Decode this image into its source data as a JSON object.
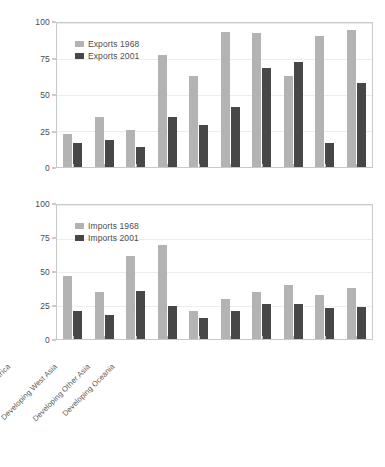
{
  "chart_data": [
    {
      "type": "bar",
      "title": "",
      "xlabel": "",
      "ylabel": "",
      "ylim": [
        0,
        100
      ],
      "yticks": [
        0,
        25,
        50,
        75,
        100
      ],
      "grid": true,
      "legend_position": "top-left",
      "categories": [
        "Western Europe",
        "USA & Canada",
        "Japan, Australia, New Zealand",
        "Central and Eastern Europe",
        "Rep. of S. Africa",
        "Latin America",
        "Developing Africa",
        "Developing West Asia",
        "Developing Other Asia",
        "Developing Oceania"
      ],
      "series": [
        {
          "name": "Exports 1968",
          "color": "#b3b3b3",
          "values": [
            23,
            35,
            26,
            78,
            63,
            94,
            93,
            63,
            91,
            95
          ]
        },
        {
          "name": "Exports 2001",
          "color": "#474747",
          "values": [
            17,
            19,
            14,
            35,
            29,
            42,
            69,
            73,
            17,
            58
          ]
        }
      ]
    },
    {
      "type": "bar",
      "title": "",
      "xlabel": "",
      "ylabel": "",
      "ylim": [
        0,
        100
      ],
      "yticks": [
        0,
        25,
        50,
        75,
        100
      ],
      "grid": true,
      "legend_position": "top-left",
      "categories": [
        "Western Europe",
        "USA & Canada",
        "Japan, Australia, New Zealand",
        "Central and Eastern Europe",
        "Rep. of S. Africa",
        "Latin America",
        "Developing Africa",
        "Developing West Asia",
        "Developing Other Asia",
        "Developing Oceania"
      ],
      "series": [
        {
          "name": "Imports 1968",
          "color": "#b3b3b3",
          "values": [
            47,
            35,
            62,
            70,
            21,
            30,
            35,
            40,
            33,
            38
          ]
        },
        {
          "name": "Imports 2001",
          "color": "#474747",
          "values": [
            21,
            18,
            36,
            25,
            16,
            21,
            26,
            26,
            23,
            24
          ]
        }
      ]
    }
  ]
}
